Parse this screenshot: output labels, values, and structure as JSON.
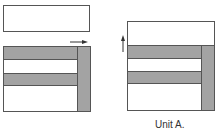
{
  "colors": {
    "shade": "#a3a3a3",
    "outline": "#555555",
    "background": "#ffffff"
  },
  "left_figure": {
    "top_rectangle": {
      "x": 3,
      "y": 5,
      "w": 87,
      "h": 27
    },
    "square": {
      "x": 3,
      "y": 46,
      "w": 88,
      "h": 66
    },
    "horizontal_bars": [
      {
        "x": 3,
        "y": 46,
        "w": 75,
        "h": 14
      },
      {
        "x": 3,
        "y": 73,
        "w": 75,
        "h": 13
      }
    ],
    "vertical_bar": {
      "x": 77,
      "y": 46,
      "w": 14,
      "h": 66
    },
    "arrow": {
      "direction": "right",
      "x1": 70,
      "y1": 42,
      "x2": 87,
      "y2": 42
    }
  },
  "right_figure": {
    "square": {
      "x": 127,
      "y": 21,
      "w": 88,
      "h": 90
    },
    "horizontal_bars": [
      {
        "x": 127,
        "y": 45,
        "w": 75,
        "h": 14
      },
      {
        "x": 127,
        "y": 71,
        "w": 75,
        "h": 13
      }
    ],
    "vertical_bar": {
      "x": 201,
      "y": 45,
      "w": 14,
      "h": 66
    },
    "arrow": {
      "direction": "up",
      "x1": 123,
      "y1": 52,
      "x2": 123,
      "y2": 36
    }
  },
  "caption": {
    "text": "Unit A.",
    "x": 155,
    "y": 119
  }
}
